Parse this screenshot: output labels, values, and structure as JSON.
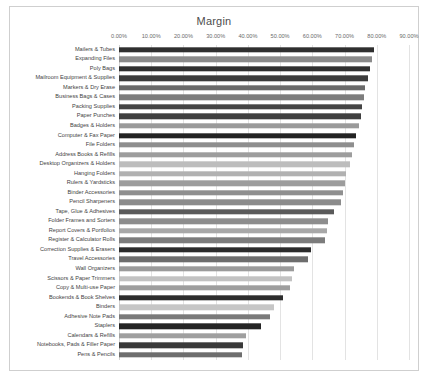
{
  "chart": {
    "title": "Margin",
    "frame_border_color": "#cfcfcf",
    "grid_color": "#e3e3e3",
    "background": "#ffffff"
  },
  "chart_data": {
    "type": "bar",
    "orientation": "horizontal",
    "title": "Margin",
    "xlabel": "",
    "ylabel": "",
    "xlim": [
      0,
      0.9
    ],
    "grid": true,
    "legend": false,
    "tick_labels": [
      "0.00%",
      "10.00%",
      "20.00%",
      "30.00%",
      "40.00%",
      "50.00%",
      "60.00%",
      "70.00%",
      "80.00%",
      "90.00%"
    ],
    "tick_values": [
      0,
      0.1,
      0.2,
      0.3,
      0.4,
      0.5,
      0.6,
      0.7,
      0.8,
      0.9
    ],
    "categories": [
      "Mailers & Tubes",
      "Expanding Files",
      "Poly Bags",
      "Mailroom Equipment & Supplies",
      "Markers & Dry Erase",
      "Business Bags & Cases",
      "Packing Supplies",
      "Paper Punches",
      "Badges & Holders",
      "Computer & Fax Paper",
      "File Folders",
      "Address Books & Refills",
      "Desktop Organizers & Holders",
      "Hanging Folders",
      "Rulers & Yardsticks",
      "Binder Accessories",
      "Pencil Sharpeners",
      "Tape, Glue & Adhesives",
      "Folder Frames and Sorters",
      "Report Covers & Portfolios",
      "Register & Calculator Rolls",
      "Correction Supplies & Erasers",
      "Travel Accessories",
      "Wall Organizers",
      "Scissors & Paper Trimmers",
      "Copy & Multi-use Paper",
      "Bookends & Book Shelves",
      "Binders",
      "Adhesive Note Pads",
      "Staplers",
      "Calendars & Refills",
      "Notebooks, Pads & Filler Paper",
      "Pens & Pencils"
    ],
    "values": [
      0.79,
      0.785,
      0.778,
      0.772,
      0.763,
      0.76,
      0.755,
      0.75,
      0.745,
      0.735,
      0.73,
      0.722,
      0.716,
      0.705,
      0.7,
      0.696,
      0.69,
      0.668,
      0.648,
      0.645,
      0.64,
      0.595,
      0.585,
      0.543,
      0.538,
      0.532,
      0.51,
      0.48,
      0.468,
      0.44,
      0.393,
      0.385,
      0.383
    ],
    "bar_colors": [
      "#2f2f2f",
      "#8a8a8a",
      "#303030",
      "#3c3c3c",
      "#6a6a6a",
      "#7d7d7d",
      "#454545",
      "#3f3f3f",
      "#9a9a9a",
      "#232323",
      "#8e8e8e",
      "#9d9d9d",
      "#bdbdbd",
      "#b1b1b1",
      "#9c9c9c",
      "#8f8f8f",
      "#8b8b8b",
      "#5a5a5a",
      "#8d8d8d",
      "#a8a8a8",
      "#7c7c7c",
      "#2b2b2b",
      "#6d6d6d",
      "#9b9b9b",
      "#c2c2c2",
      "#9e9e9e",
      "#2d2d2d",
      "#c6c6c6",
      "#7a7a7a",
      "#242424",
      "#9f9f9f",
      "#3a3a3a",
      "#6e6e6e"
    ]
  }
}
